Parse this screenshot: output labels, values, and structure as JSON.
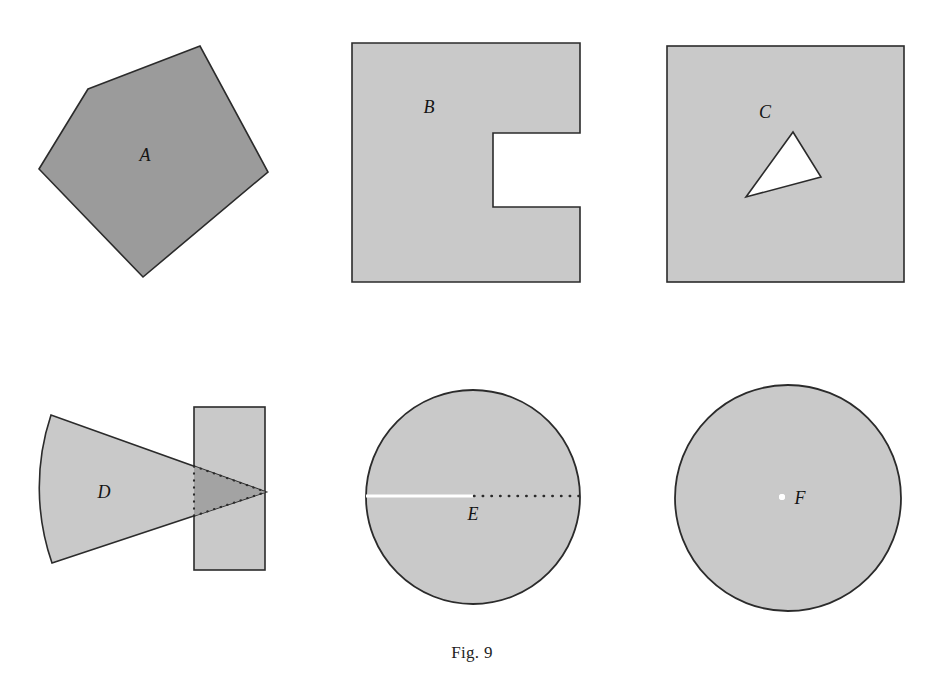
{
  "figure": {
    "caption": "Fig. 9",
    "caption_position": {
      "x": 472,
      "y": 643
    },
    "background_color": "#ffffff",
    "outline_color": "#2b2b2b",
    "fill_light": "#c9c9c9",
    "fill_dark": "#9b9b9b",
    "fill_overlap": "#a3a3a3",
    "hole_color": "#ffffff",
    "label_color": "#141414"
  },
  "shapes": [
    {
      "id": "A",
      "label": "A",
      "kind": "pentagon",
      "description": "filled convex pentagon, darker gray",
      "fill": "#9b9b9b",
      "stroke": "#2b2b2b",
      "label_position": {
        "x": 145,
        "y": 161
      },
      "points": "88,89 200,46 268,172 143,277 39,169"
    },
    {
      "id": "B",
      "label": "B",
      "kind": "c-shape",
      "description": "square with rectangular notch removed from the right side",
      "fill": "#c9c9c9",
      "stroke": "#2b2b2b",
      "label_position": {
        "x": 429,
        "y": 113
      },
      "points": "352,43 580,43 580,133 493,133 493,207 580,207 580,282 352,282"
    },
    {
      "id": "C",
      "label": "C",
      "kind": "square-with-triangular-hole",
      "description": "filled square containing a white triangular hole",
      "fill": "#c9c9c9",
      "stroke": "#2b2b2b",
      "label_position": {
        "x": 765,
        "y": 118
      },
      "square": {
        "x": 667,
        "y": 46,
        "width": 237,
        "height": 236
      },
      "hole_points": "793,132 821,177 746,197"
    },
    {
      "id": "D",
      "label": "D",
      "kind": "sector-and-rectangle",
      "description": "circular sector overlapping a rectangle; dotted boundary on the overlap",
      "fill": "#c9c9c9",
      "fill_overlap": "#a3a3a3",
      "stroke": "#2b2b2b",
      "label_position": {
        "x": 104,
        "y": 498
      },
      "sector": {
        "apex_x": 266,
        "apex_y": 492,
        "arc_top_x": 51,
        "arc_top_y": 415,
        "arc_bottom_x": 52,
        "arc_bottom_y": 563,
        "arc_radius": 230
      },
      "rectangle": {
        "x": 194,
        "y": 407,
        "width": 71,
        "height": 163
      }
    },
    {
      "id": "E",
      "label": "E",
      "kind": "circle-with-slit",
      "description": "filled disc with a white solid radius on the left and a dotted radius on the right",
      "fill": "#c9c9c9",
      "stroke": "#2b2b2b",
      "slit_color": "#ffffff",
      "dotted_color": "#2b2b2b",
      "label_position": {
        "x": 473,
        "y": 520
      },
      "circle": {
        "cx": 473,
        "cy": 497,
        "r": 107
      },
      "solid_slit": {
        "x1": 366,
        "y1": 496,
        "x2": 473,
        "y2": 496
      },
      "dotted_radius": {
        "x1": 473,
        "y1": 496,
        "x2": 580,
        "y2": 496
      }
    },
    {
      "id": "F",
      "label": "F",
      "kind": "punctured-disc",
      "description": "filled disc with a small white dot removed at the center",
      "fill": "#c9c9c9",
      "stroke": "#2b2b2b",
      "puncture_color": "#ffffff",
      "label_position": {
        "x": 800,
        "y": 504
      },
      "circle": {
        "cx": 788,
        "cy": 498,
        "r": 113
      },
      "puncture": {
        "cx": 782,
        "cy": 497,
        "r": 3
      }
    }
  ]
}
